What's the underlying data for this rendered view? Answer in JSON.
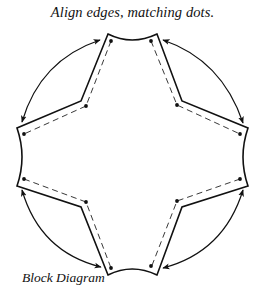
{
  "diagram": {
    "title": "Align edges, matching dots.",
    "caption": "Block Diagram",
    "colors": {
      "stroke": "#111111",
      "background": "#ffffff"
    },
    "pieces": [
      {
        "name": "top-edge",
        "type": "concave-curve"
      },
      {
        "name": "right-edge",
        "type": "concave-curve"
      },
      {
        "name": "bottom-edge",
        "type": "concave-curve"
      },
      {
        "name": "left-edge",
        "type": "concave-curve"
      }
    ],
    "arrows": [
      {
        "name": "top-left-arrow",
        "connects": [
          "top-edge",
          "left-edge"
        ]
      },
      {
        "name": "top-right-arrow",
        "connects": [
          "top-edge",
          "right-edge"
        ]
      },
      {
        "name": "bottom-left-arrow",
        "connects": [
          "left-edge",
          "bottom-edge"
        ]
      },
      {
        "name": "bottom-right-arrow",
        "connects": [
          "right-edge",
          "bottom-edge"
        ]
      }
    ],
    "dot_count": 12
  }
}
